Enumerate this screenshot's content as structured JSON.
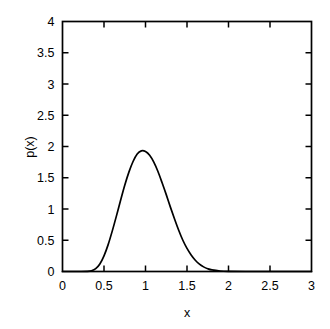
{
  "chart_data": {
    "type": "line",
    "title": "",
    "subtitle": "",
    "xlabel": "x",
    "ylabel": "p(x)",
    "xlim": [
      0,
      3
    ],
    "ylim": [
      0,
      4
    ],
    "grid": false,
    "legend": null,
    "legend_position": "none",
    "line_color": "#000000",
    "background_color": "#ffffff",
    "axis_color": "#000000",
    "xticks": [
      0,
      0.5,
      1,
      1.5,
      2,
      2.5,
      3
    ],
    "xtick_labels": [
      "0",
      "0.5",
      "1",
      "1.5",
      "2",
      "2.5",
      "3"
    ],
    "yticks": [
      0,
      0.5,
      1,
      1.5,
      2,
      2.5,
      3,
      3.5,
      4
    ],
    "ytick_labels": [
      "0",
      "0.5",
      "1",
      "1.5",
      "2",
      "2.5",
      "3",
      "3.5",
      "4"
    ],
    "peak_x": 0.96,
    "peak_y": 1.93,
    "series": [
      {
        "name": "p(x)",
        "x": [
          0.0,
          0.1,
          0.2,
          0.3,
          0.35,
          0.4,
          0.45,
          0.5,
          0.55,
          0.6,
          0.65,
          0.7,
          0.75,
          0.8,
          0.85,
          0.9,
          0.95,
          1.0,
          1.05,
          1.1,
          1.15,
          1.2,
          1.25,
          1.3,
          1.35,
          1.4,
          1.45,
          1.5,
          1.55,
          1.6,
          1.65,
          1.7,
          1.75,
          1.8,
          1.9,
          2.0,
          2.2,
          2.5,
          3.0
        ],
        "y": [
          0.0,
          0.0,
          0.0,
          0.002,
          0.012,
          0.045,
          0.12,
          0.25,
          0.43,
          0.65,
          0.89,
          1.14,
          1.38,
          1.59,
          1.76,
          1.88,
          1.93,
          1.92,
          1.86,
          1.75,
          1.6,
          1.42,
          1.23,
          1.03,
          0.84,
          0.66,
          0.5,
          0.37,
          0.265,
          0.18,
          0.118,
          0.074,
          0.044,
          0.025,
          0.008,
          0.002,
          0.0,
          0.0,
          0.0
        ]
      }
    ]
  }
}
